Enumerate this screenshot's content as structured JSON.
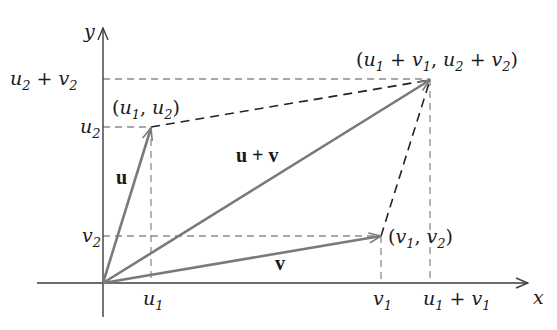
{
  "diagram": {
    "type": "vector-addition-parallelogram",
    "axes": {
      "x_label": "x",
      "y_label": "y"
    },
    "vectors": [
      {
        "name": "u",
        "label": "u",
        "tip_label_prefix": "(",
        "tip": "(u1, u2)"
      },
      {
        "name": "v",
        "label": "v",
        "tip": "(v1, v2)"
      },
      {
        "name": "u_plus_v",
        "label": "u + v",
        "tip": "(u1 + v1, u2 + v2)"
      }
    ],
    "x_ticks": [
      "u1",
      "v1",
      "u1 + v1"
    ],
    "y_ticks": [
      "u2 + v2",
      "u2",
      "v2"
    ],
    "colors": {
      "vector": "#7a7a7a",
      "parallelogram_dash": "#222222",
      "projection_dash": "#8c8c8c",
      "axis": "#3c3c3c"
    }
  },
  "text": {
    "y_axis": "y",
    "x_axis": "x",
    "u_label": "u",
    "v_label": "v",
    "uv_label": "u + v",
    "tick_u": "u",
    "tick_v": "v",
    "sub1": "1",
    "sub2": "2",
    "plus": " + ",
    "comma": ", ",
    "lparen": "(",
    "rparen": ")"
  }
}
